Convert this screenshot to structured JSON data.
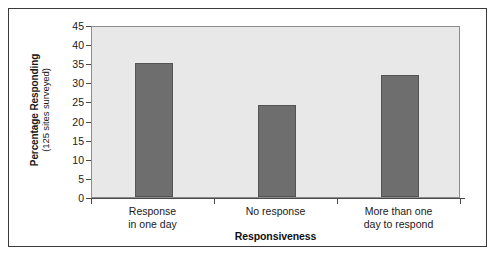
{
  "chart_data": {
    "type": "bar",
    "title": "",
    "categories": [
      "Response in one day",
      "No response",
      "More than one day to respond"
    ],
    "category_lines": [
      [
        "Response",
        "in one day"
      ],
      [
        "No response",
        ""
      ],
      [
        "More than one",
        "day to respond"
      ]
    ],
    "values": [
      35,
      24,
      32
    ],
    "xlabel": "Responsiveness",
    "ylabel": "Percentage Responding",
    "ylabel_sub": "(125 sites surveyed)",
    "ylim": [
      0,
      45
    ],
    "yticks": [
      0,
      5,
      10,
      15,
      20,
      25,
      30,
      35,
      40,
      45
    ],
    "ytick_labels": [
      "0",
      "5",
      "10",
      "15",
      "20",
      "25",
      "30",
      "35",
      "40",
      "45"
    ],
    "grid": false,
    "legend": false,
    "legend_position": "none",
    "bar_color": "#6e6e6e",
    "bar_edge_color": "#545454",
    "plot_background": "#e8e8e8",
    "plot_border_color": "#8c8c8c",
    "axis_color": "#4a4a4a",
    "frame_color": "#3a3a3a",
    "text_color": "#1a1a1a"
  }
}
